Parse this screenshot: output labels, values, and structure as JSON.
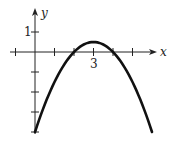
{
  "chart_data": {
    "type": "line",
    "title": "",
    "xlabel": "x",
    "ylabel": "y",
    "function": "y = -0.5(x-2)(x-4) = -0.5x^2 + 3x - 4",
    "x": [
      0,
      0.5,
      1,
      1.5,
      2,
      2.5,
      3,
      3.5,
      4,
      4.5,
      5,
      5.5,
      6
    ],
    "series": [
      {
        "name": "parabola",
        "values": [
          -4,
          -2.625,
          -1.5,
          -0.625,
          0,
          0.375,
          0.5,
          0.375,
          0,
          -0.625,
          -1.5,
          -2.625,
          -4
        ]
      }
    ],
    "x_ticks": [
      -1,
      1,
      2,
      3,
      4,
      5
    ],
    "y_ticks": [
      1,
      -1,
      -2,
      -3,
      -4
    ],
    "x_tick_labels": [
      {
        "value": 3,
        "label": "3"
      }
    ],
    "y_tick_labels": [
      {
        "value": 1,
        "label": "1"
      }
    ],
    "xlim": [
      -1.3,
      6.5
    ],
    "ylim": [
      -4.2,
      2.1
    ],
    "grid": false,
    "legend": "none"
  },
  "labels": {
    "x_axis": "x",
    "y_axis": "y",
    "x_tick": "3",
    "y_tick": "1"
  }
}
